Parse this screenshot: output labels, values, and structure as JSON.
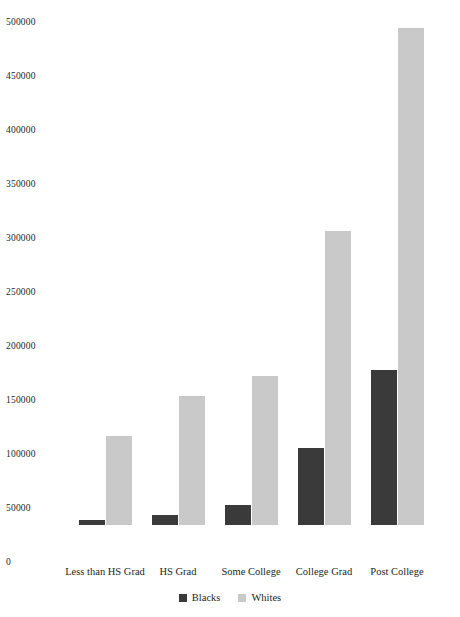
{
  "chart_data": {
    "type": "bar",
    "title": "",
    "subtitle": "",
    "xlabel": "",
    "ylabel": "",
    "categories": [
      "Less than HS Grad",
      "HS Grad",
      "Some College",
      "College Grad",
      "Post College"
    ],
    "series": [
      {
        "name": "Blacks",
        "color": "#3a3a3a",
        "values": [
          4500,
          9000,
          18500,
          71000,
          143500
        ]
      },
      {
        "name": "Whites",
        "color": "#c9c9c9",
        "values": [
          82500,
          119500,
          138000,
          272000,
          460000
        ]
      }
    ],
    "ylim": [
      0,
      500000
    ],
    "yticks": [
      0,
      50000,
      100000,
      150000,
      200000,
      250000,
      300000,
      350000,
      400000,
      450000,
      500000
    ],
    "ytick_labels": [
      "0",
      "50000",
      "100000",
      "150000",
      "200000",
      "250000",
      "300000",
      "350000",
      "400000",
      "450000",
      "500000"
    ],
    "grid": false,
    "legend_position": "bottom",
    "background_color": "#ffffff"
  },
  "axis": {
    "y_ticks": [
      {
        "label": "500000",
        "value": 500000
      },
      {
        "label": "450000",
        "value": 450000
      },
      {
        "label": "400000",
        "value": 400000
      },
      {
        "label": "350000",
        "value": 350000
      },
      {
        "label": "300000",
        "value": 300000
      },
      {
        "label": "250000",
        "value": 250000
      },
      {
        "label": "200000",
        "value": 200000
      },
      {
        "label": "150000",
        "value": 150000
      },
      {
        "label": "100000",
        "value": 100000
      },
      {
        "label": "50000",
        "value": 50000
      },
      {
        "label": "0",
        "value": 0
      }
    ],
    "x_categories": [
      {
        "label": "Less than HS Grad"
      },
      {
        "label": "HS Grad"
      },
      {
        "label": "Some College"
      },
      {
        "label": "College Grad"
      },
      {
        "label": "Post College"
      }
    ]
  },
  "legend": {
    "entries": [
      {
        "label": "Blacks",
        "color": "#3a3a3a"
      },
      {
        "label": "Whites",
        "color": "#c9c9c9"
      }
    ]
  }
}
